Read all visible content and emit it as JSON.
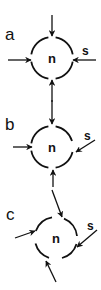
{
  "diagram": {
    "colors": {
      "ink": "#111111",
      "background": "#ffffff"
    },
    "panels": [
      {
        "id": "a",
        "label": "a",
        "node": "n",
        "side_label": "s",
        "arrows": [
          "top-vertical-in",
          "left-horizontal-in",
          "right-horizontal-in (s)",
          "bottom-vertical-in"
        ]
      },
      {
        "id": "b",
        "label": "b",
        "node": "n",
        "side_label": "s",
        "arrows": [
          "top-vertical-in",
          "left-horizontal-in",
          "right-diagonal-in (s)",
          "bottom-vertical-in"
        ]
      },
      {
        "id": "c",
        "label": "c",
        "node": "n",
        "side_label": "s",
        "arrows": [
          "top-diagonal-in",
          "left-diagonal-in",
          "right-diagonal-in (s)",
          "bottom-diagonal-in"
        ]
      }
    ]
  }
}
